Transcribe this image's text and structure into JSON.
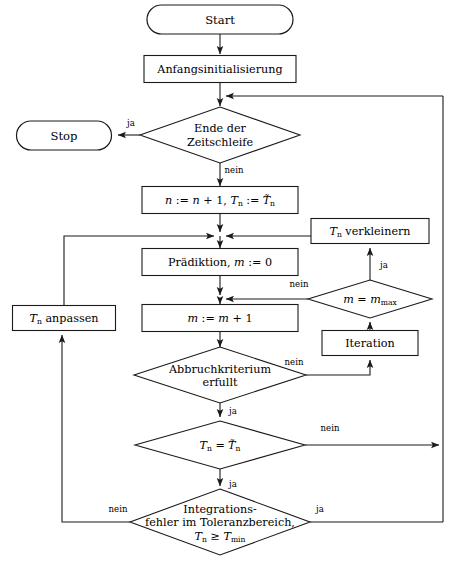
{
  "diagram": {
    "type": "flowchart",
    "language": "de",
    "colors": {
      "stroke": "#1a1a1a",
      "fill": "#ffffff",
      "text": "#000000"
    },
    "canvas": {
      "width": 451,
      "height": 566
    }
  },
  "nodes": {
    "start": {
      "label": "Start",
      "shape": "terminator",
      "cx": 220,
      "cy": 19,
      "w": 146,
      "h": 29
    },
    "stop": {
      "label": "Stop",
      "shape": "terminator",
      "cx": 64,
      "cy": 135,
      "w": 95,
      "h": 29
    },
    "init": {
      "label": "Anfangsinitialisierung",
      "shape": "process",
      "cx": 220,
      "cy": 69,
      "w": 152,
      "h": 27
    },
    "time_loop_end": {
      "line1": "Ende der",
      "line2": "Zeitschleife",
      "shape": "decision",
      "cx": 220,
      "cy": 135,
      "w": 160,
      "h": 56
    },
    "increment": {
      "label": "n := n + 1, Tn := T~n",
      "shape": "process",
      "cx": 220,
      "cy": 200,
      "w": 156,
      "h": 27
    },
    "reduce_tn": {
      "label": "Tn verkleinern",
      "shape": "process",
      "cx": 370,
      "cy": 231,
      "w": 118,
      "h": 25
    },
    "prediction": {
      "label": "Pradiktion, m := 0",
      "shape": "process",
      "cx": 220,
      "cy": 262,
      "w": 156,
      "h": 27
    },
    "adapt_tn": {
      "label": "Tn anpassen",
      "shape": "process",
      "cx": 64,
      "cy": 318,
      "w": 103,
      "h": 25
    },
    "m_eq_mmax": {
      "label": "m = mmax",
      "shape": "decision",
      "cx": 370,
      "cy": 299,
      "w": 124,
      "h": 38
    },
    "m_increment": {
      "label": "m := m + 1",
      "shape": "process",
      "cx": 220,
      "cy": 318,
      "w": 156,
      "h": 27
    },
    "iteration": {
      "label": "Iteration",
      "shape": "process",
      "cx": 370,
      "cy": 343,
      "w": 96,
      "h": 25
    },
    "abort_criterion": {
      "line1": "Abbruchkriterium",
      "line2": "erfullt",
      "shape": "decision",
      "cx": 220,
      "cy": 375,
      "w": 172,
      "h": 48
    },
    "tn_eq_tn": {
      "label": "Tn = T~n",
      "shape": "decision",
      "cx": 220,
      "cy": 445,
      "w": 170,
      "h": 48
    },
    "integration_err": {
      "line1": "Integrations-",
      "line2": "fehler im Toleranzbereich,",
      "line3": "Tn >= Tmin",
      "shape": "decision",
      "cx": 220,
      "cy": 522,
      "w": 180,
      "h": 66
    }
  },
  "edge_labels": {
    "time_loop_ja": {
      "text": "ja",
      "x": 131,
      "y": 123
    },
    "time_loop_nein": {
      "text": "nein",
      "x": 234,
      "y": 170
    },
    "mmax_ja": {
      "text": "ja",
      "x": 384,
      "y": 265
    },
    "mmax_nein": {
      "text": "nein",
      "x": 299,
      "y": 284
    },
    "abort_nein": {
      "text": "nein",
      "x": 294,
      "y": 362
    },
    "abort_ja": {
      "text": "ja",
      "x": 233,
      "y": 411
    },
    "tn_eq_nein": {
      "text": "nein",
      "x": 330,
      "y": 428
    },
    "tn_eq_ja": {
      "text": "ja",
      "x": 233,
      "y": 484
    },
    "integ_nein": {
      "text": "nein",
      "x": 118,
      "y": 509
    },
    "integ_ja": {
      "text": "ja",
      "x": 320,
      "y": 509
    }
  },
  "routing": {
    "right_bus_x": 443,
    "left_bus_x": 62,
    "main_column_x": 220,
    "feedback_top_y": 96,
    "feedback_mid_y": 236,
    "feedback_bottom_y": 522,
    "mmax_nein_join_y": 299
  }
}
